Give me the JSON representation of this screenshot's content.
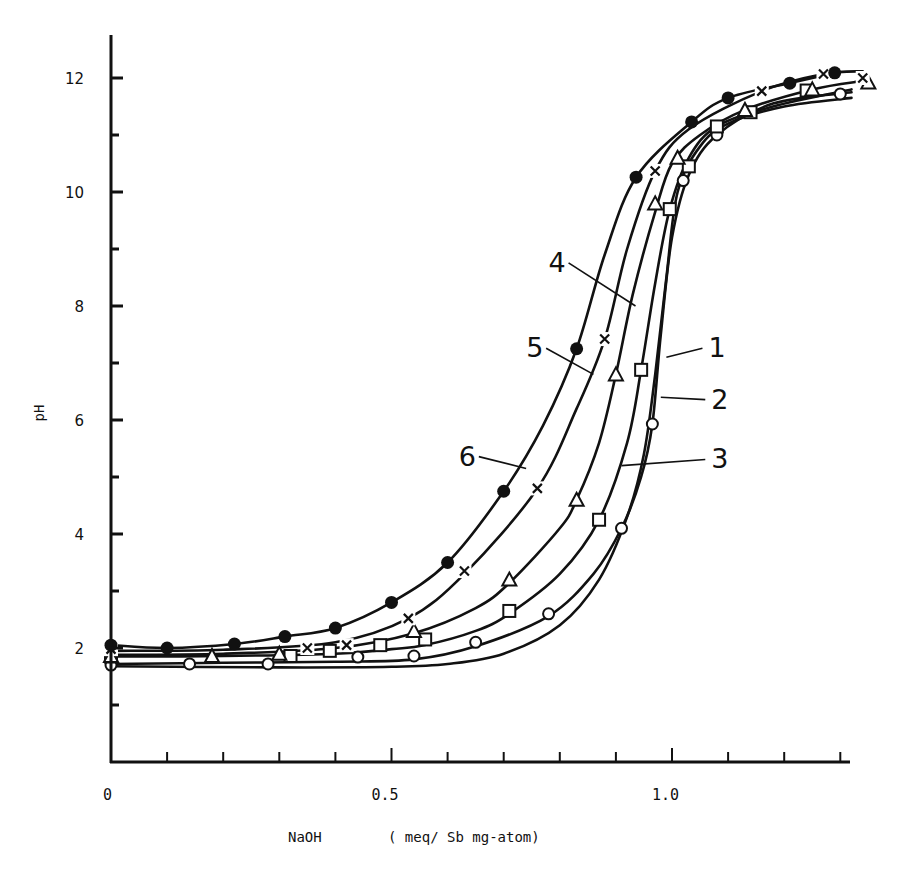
{
  "chart_data": {
    "type": "line",
    "title": "",
    "xlabel": "NaOH    ( meq/ Sb mg-atom)",
    "ylabel": "pH",
    "xlim": [
      0,
      1.32
    ],
    "ylim": [
      0,
      12.6
    ],
    "x_ticks": [
      0,
      0.1,
      0.2,
      0.3,
      0.4,
      0.5,
      0.6,
      0.7,
      0.8,
      0.9,
      1.0,
      1.1,
      1.2,
      1.3
    ],
    "x_tick_labels": [
      {
        "value": 0,
        "label": "0"
      },
      {
        "value": 0.5,
        "label": "0.5"
      },
      {
        "value": 1.0,
        "label": "1.0"
      }
    ],
    "y_ticks": [
      1,
      2,
      3,
      4,
      5,
      6,
      7,
      8,
      9,
      10,
      11,
      12
    ],
    "y_tick_labels": [
      {
        "value": 2,
        "label": "2"
      },
      {
        "value": 4,
        "label": "4"
      },
      {
        "value": 6,
        "label": "6"
      },
      {
        "value": 8,
        "label": "8"
      },
      {
        "value": 10,
        "label": "10"
      },
      {
        "value": 12,
        "label": "12"
      }
    ],
    "grid": false,
    "legend": "inline curve labels 1-6",
    "series": [
      {
        "name": "1",
        "marker": "none",
        "curve": [
          [
            0.0,
            1.68
          ],
          [
            0.3,
            1.66
          ],
          [
            0.5,
            1.67
          ],
          [
            0.6,
            1.72
          ],
          [
            0.7,
            1.9
          ],
          [
            0.8,
            2.4
          ],
          [
            0.87,
            3.2
          ],
          [
            0.92,
            4.3
          ],
          [
            0.95,
            5.4
          ],
          [
            0.97,
            6.8
          ],
          [
            0.99,
            8.5
          ],
          [
            1.01,
            10.0
          ],
          [
            1.05,
            10.8
          ],
          [
            1.1,
            11.2
          ],
          [
            1.2,
            11.5
          ],
          [
            1.32,
            11.65
          ]
        ],
        "values": []
      },
      {
        "name": "2",
        "marker": "open-circle",
        "curve": [
          [
            0.0,
            1.72
          ],
          [
            0.2,
            1.74
          ],
          [
            0.4,
            1.76
          ],
          [
            0.54,
            1.8
          ],
          [
            0.65,
            2.03
          ],
          [
            0.78,
            2.56
          ],
          [
            0.86,
            3.3
          ],
          [
            0.91,
            4.1
          ],
          [
            0.945,
            5.0
          ],
          [
            0.965,
            5.93
          ],
          [
            0.98,
            7.5
          ],
          [
            1.0,
            9.2
          ],
          [
            1.03,
            10.3
          ],
          [
            1.08,
            11.0
          ],
          [
            1.18,
            11.55
          ],
          [
            1.32,
            11.75
          ]
        ],
        "values": [
          [
            0.0,
            1.7
          ],
          [
            0.14,
            1.72
          ],
          [
            0.28,
            1.72
          ],
          [
            0.44,
            1.84
          ],
          [
            0.54,
            1.86
          ],
          [
            0.65,
            2.1
          ],
          [
            0.78,
            2.6
          ],
          [
            0.91,
            4.1
          ],
          [
            0.965,
            5.93
          ],
          [
            1.02,
            10.2
          ],
          [
            1.08,
            11.0
          ],
          [
            1.3,
            11.72
          ]
        ]
      },
      {
        "name": "3",
        "marker": "open-square",
        "curve": [
          [
            0.0,
            1.85
          ],
          [
            0.2,
            1.86
          ],
          [
            0.4,
            1.9
          ],
          [
            0.5,
            1.98
          ],
          [
            0.56,
            2.05
          ],
          [
            0.65,
            2.3
          ],
          [
            0.71,
            2.6
          ],
          [
            0.8,
            3.3
          ],
          [
            0.87,
            4.25
          ],
          [
            0.92,
            5.6
          ],
          [
            0.945,
            6.88
          ],
          [
            0.97,
            8.4
          ],
          [
            0.996,
            9.7
          ],
          [
            1.03,
            10.6
          ],
          [
            1.08,
            11.15
          ],
          [
            1.18,
            11.5
          ],
          [
            1.32,
            11.8
          ]
        ],
        "values": [
          [
            0.0,
            1.85
          ],
          [
            0.32,
            1.86
          ],
          [
            0.39,
            1.95
          ],
          [
            0.48,
            2.05
          ],
          [
            0.56,
            2.15
          ],
          [
            0.71,
            2.65
          ],
          [
            0.87,
            4.25
          ],
          [
            0.945,
            6.88
          ],
          [
            0.996,
            9.7
          ],
          [
            1.03,
            10.45
          ],
          [
            1.08,
            11.15
          ],
          [
            1.14,
            11.4
          ],
          [
            1.24,
            11.78
          ]
        ]
      },
      {
        "name": "4",
        "marker": "open-triangle",
        "curve": [
          [
            0.0,
            1.88
          ],
          [
            0.2,
            1.9
          ],
          [
            0.4,
            2.0
          ],
          [
            0.54,
            2.26
          ],
          [
            0.65,
            2.7
          ],
          [
            0.71,
            3.14
          ],
          [
            0.8,
            4.1
          ],
          [
            0.83,
            4.6
          ],
          [
            0.87,
            5.6
          ],
          [
            0.9,
            6.8
          ],
          [
            0.93,
            8.2
          ],
          [
            0.97,
            9.65
          ],
          [
            1.0,
            10.5
          ],
          [
            1.05,
            11.0
          ],
          [
            1.13,
            11.44
          ],
          [
            1.25,
            11.8
          ],
          [
            1.34,
            11.95
          ]
        ],
        "values": [
          [
            0.0,
            1.86
          ],
          [
            0.18,
            1.86
          ],
          [
            0.3,
            1.9
          ],
          [
            0.54,
            2.3
          ],
          [
            0.71,
            3.2
          ],
          [
            0.83,
            4.6
          ],
          [
            0.9,
            6.8
          ],
          [
            0.97,
            9.8
          ],
          [
            1.01,
            10.6
          ],
          [
            1.13,
            11.44
          ],
          [
            1.25,
            11.8
          ],
          [
            1.35,
            11.92
          ]
        ]
      },
      {
        "name": "5",
        "marker": "x",
        "curve": [
          [
            0.0,
            1.95
          ],
          [
            0.2,
            1.97
          ],
          [
            0.4,
            2.1
          ],
          [
            0.53,
            2.52
          ],
          [
            0.63,
            3.3
          ],
          [
            0.76,
            4.8
          ],
          [
            0.83,
            6.2
          ],
          [
            0.88,
            7.42
          ],
          [
            0.92,
            9.0
          ],
          [
            0.97,
            10.37
          ],
          [
            1.03,
            11.1
          ],
          [
            1.16,
            11.77
          ],
          [
            1.27,
            12.07
          ],
          [
            1.34,
            12.12
          ]
        ],
        "values": [
          [
            0.0,
            1.98
          ],
          [
            0.35,
            2.0
          ],
          [
            0.42,
            2.05
          ],
          [
            0.53,
            2.52
          ],
          [
            0.63,
            3.35
          ],
          [
            0.76,
            4.8
          ],
          [
            0.88,
            7.42
          ],
          [
            0.97,
            10.37
          ],
          [
            1.16,
            11.77
          ],
          [
            1.27,
            12.07
          ],
          [
            1.34,
            12.0
          ]
        ]
      },
      {
        "name": "6",
        "marker": "filled-circle",
        "curve": [
          [
            0.0,
            2.05
          ],
          [
            0.1,
            2.0
          ],
          [
            0.22,
            2.07
          ],
          [
            0.31,
            2.2
          ],
          [
            0.4,
            2.35
          ],
          [
            0.5,
            2.8
          ],
          [
            0.6,
            3.5
          ],
          [
            0.7,
            4.75
          ],
          [
            0.77,
            5.9
          ],
          [
            0.83,
            7.25
          ],
          [
            0.88,
            8.9
          ],
          [
            0.936,
            10.26
          ],
          [
            1.035,
            11.23
          ],
          [
            1.1,
            11.65
          ],
          [
            1.21,
            11.91
          ],
          [
            1.29,
            12.09
          ]
        ],
        "values": [
          [
            0.0,
            2.05
          ],
          [
            0.1,
            2.0
          ],
          [
            0.22,
            2.07
          ],
          [
            0.31,
            2.2
          ],
          [
            0.4,
            2.35
          ],
          [
            0.5,
            2.8
          ],
          [
            0.6,
            3.5
          ],
          [
            0.7,
            4.75
          ],
          [
            0.83,
            7.25
          ],
          [
            0.936,
            10.26
          ],
          [
            1.035,
            11.23
          ],
          [
            1.1,
            11.65
          ],
          [
            1.21,
            11.91
          ],
          [
            1.29,
            12.09
          ]
        ]
      }
    ],
    "annotations": [
      {
        "label": "1",
        "text_x": 1.065,
        "text_y": 7.1,
        "leader_to": [
          0.99,
          7.1
        ]
      },
      {
        "label": "2",
        "text_x": 1.07,
        "text_y": 6.2,
        "leader_to": [
          0.98,
          6.4
        ]
      },
      {
        "label": "3",
        "text_x": 1.07,
        "text_y": 5.15,
        "leader_to": [
          0.91,
          5.2
        ]
      },
      {
        "label": "4",
        "text_x": 0.78,
        "text_y": 8.6,
        "leader_to": [
          0.935,
          8.0
        ]
      },
      {
        "label": "5",
        "text_x": 0.74,
        "text_y": 7.1,
        "leader_to": [
          0.86,
          6.8
        ]
      },
      {
        "label": "6",
        "text_x": 0.62,
        "text_y": 5.2,
        "leader_to": [
          0.74,
          5.15
        ]
      }
    ]
  },
  "figure": {
    "x_axis_title_left": "NaOH",
    "x_axis_title_right": "( meq/ Sb mg-atom)",
    "y_axis_title": "pH"
  }
}
